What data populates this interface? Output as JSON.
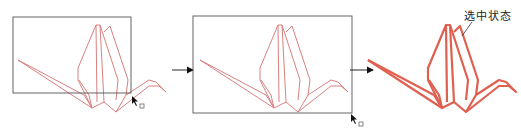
{
  "diagram": {
    "steps": [
      {
        "id": "step-1",
        "description": "unselected crane with partial selection rectangle"
      },
      {
        "id": "step-2",
        "description": "selection rectangle fully enclosing crane"
      },
      {
        "id": "step-3",
        "description": "crane in selected state"
      }
    ],
    "selected_label": "选中状态",
    "colors": {
      "crane_stroke": "#d98080",
      "crane_selected_stroke": "#e06050",
      "selection_box": "#555555",
      "arrow": "#111111"
    }
  }
}
